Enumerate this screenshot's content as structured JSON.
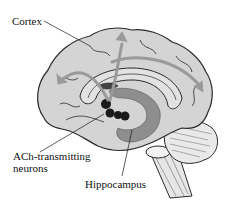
{
  "diagram": {
    "labels": {
      "cortex": "Cortex",
      "ach_line1": "ACh-transmitting",
      "ach_line2": "neurons",
      "hippocampus": "Hippocampus"
    },
    "colors": {
      "brain_fill": "#d4d4d4",
      "outline": "#2a2a2a",
      "arrow": "#9a9a9a",
      "hippocampus": "#8e8e8e",
      "neurons": "#1a1a1a",
      "background": "#ffffff"
    }
  }
}
